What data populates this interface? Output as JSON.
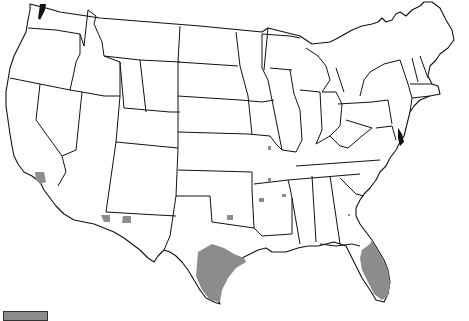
{
  "map": {
    "title": "",
    "region": "Contiguous United States",
    "style": "State outlines with shaded counties",
    "colors": {
      "background": "#ffffff",
      "border": "#111111",
      "shaded": "#8c8c8c"
    },
    "shaded_areas": [
      {
        "name": "Southern California county",
        "state": "California"
      },
      {
        "name": "Southern Arizona counties",
        "state": "Arizona"
      },
      {
        "name": "Southern New Mexico county",
        "state": "New Mexico"
      },
      {
        "name": "South Texas region",
        "state": "Texas"
      },
      {
        "name": "North Texas county",
        "state": "Texas"
      },
      {
        "name": "Missouri counties",
        "state": "Missouri"
      },
      {
        "name": "Arkansas counties",
        "state": "Arkansas"
      },
      {
        "name": "Georgia county",
        "state": "Georgia"
      },
      {
        "name": "Peninsular Florida",
        "state": "Florida"
      }
    ]
  },
  "legend": {
    "swatch_color": "#8c8c8c",
    "label": ""
  }
}
